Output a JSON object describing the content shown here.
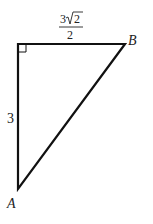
{
  "diagram": {
    "type": "right-triangle",
    "vertices": {
      "right_angle": {
        "label": "",
        "x": 18,
        "y": 44
      },
      "B": {
        "label": "B",
        "x": 125,
        "y": 44
      },
      "A": {
        "label": "A",
        "x": 18,
        "y": 189
      }
    },
    "sides": {
      "top": {
        "numerator": "3",
        "radicand": "2",
        "denominator": "2",
        "text": "3√2/2"
      },
      "left": {
        "label": "3"
      }
    },
    "right_angle_marker": true,
    "stroke_color": "#111111"
  }
}
